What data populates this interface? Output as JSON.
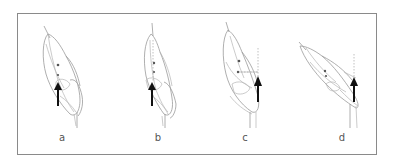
{
  "figure": {
    "panels": [
      {
        "id": "a",
        "label": "a",
        "has_dashed_axis": false
      },
      {
        "id": "b",
        "label": "b",
        "has_dashed_axis": true
      },
      {
        "id": "c",
        "label": "c",
        "has_dashed_axis": true
      },
      {
        "id": "d",
        "label": "d",
        "has_dashed_axis": true
      }
    ],
    "colors": {
      "frame": "#8a8a8a",
      "outline": "#9a9a9a",
      "arrow": "#111111",
      "dot": "#555555"
    }
  }
}
